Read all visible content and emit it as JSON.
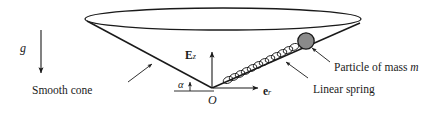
{
  "figure": {
    "background_color": "#ffffff",
    "line_color": "#1a1a1a",
    "particle_fill": "#8a8a8a",
    "particle_stroke": "#1a1a1a",
    "width": 430,
    "height": 116
  },
  "labels": {
    "gravity": "g",
    "smooth_cone": "Smooth cone",
    "origin": "O",
    "angle": "α",
    "particle": "Particle of mass ",
    "particle_mass_symbol": "m",
    "linear_spring": "Linear spring",
    "ez_vector": "E",
    "ez_subscript": "z",
    "er_vector": "e",
    "er_subscript": "r"
  },
  "geometry": {
    "cone_rim_center_x": 223,
    "cone_rim_center_y": 19,
    "cone_rim_rx": 138,
    "cone_rim_ry": 11,
    "apex_x": 212,
    "apex_y": 88,
    "left_rim_x": 88,
    "left_rim_y": 22,
    "right_rim_x": 359,
    "right_rim_y": 23,
    "particle_cx": 306,
    "particle_cy": 41,
    "particle_r": 8,
    "gravity_arrow_x": 41,
    "gravity_arrow_top": 30,
    "gravity_arrow_bottom": 76,
    "ez_arrow_top": 50,
    "er_arrow_end_x": 262
  }
}
